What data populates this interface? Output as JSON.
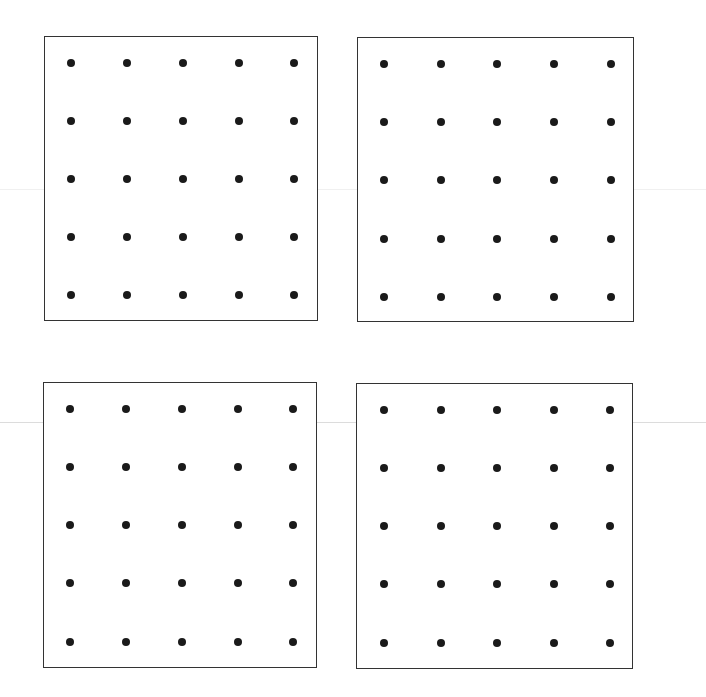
{
  "page": {
    "background_color": "#ffffff",
    "dot_color": "#1a1a1a",
    "border_color": "#333333",
    "scan_line_color": "#e2e2e2"
  },
  "panels": [
    {
      "id": "top-left",
      "rows": 5,
      "cols": 5
    },
    {
      "id": "top-right",
      "rows": 5,
      "cols": 5
    },
    {
      "id": "bottom-left",
      "rows": 5,
      "cols": 5
    },
    {
      "id": "bottom-right",
      "rows": 5,
      "cols": 5
    }
  ]
}
